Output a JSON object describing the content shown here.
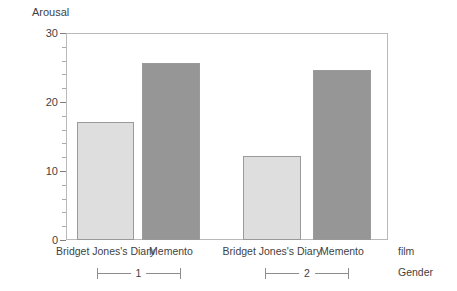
{
  "chart_data": {
    "type": "bar",
    "title": "",
    "ylabel": "Arousal",
    "xlabel": "film",
    "group_axis_label": "Gender",
    "ylim": [
      0,
      30
    ],
    "yticks": [
      0,
      10,
      20,
      30
    ],
    "ytick_labels": [
      "0",
      "10",
      "20",
      "30"
    ],
    "minor_tick_interval": 2,
    "grid": false,
    "legend": "none",
    "categories": [
      "Bridget Jones's Diary",
      "Memento"
    ],
    "groups": [
      {
        "label": "1",
        "bars": [
          {
            "category": "Bridget Jones's Diary",
            "value": 17.1,
            "color": "#dedede"
          },
          {
            "category": "Memento",
            "value": 25.6,
            "color": "#969696"
          }
        ]
      },
      {
        "label": "2",
        "bars": [
          {
            "category": "Bridget Jones's Diary",
            "value": 12.2,
            "color": "#dedede"
          },
          {
            "category": "Memento",
            "value": 24.6,
            "color": "#969696"
          }
        ]
      }
    ],
    "series": [
      {
        "name": "Bridget Jones's Diary",
        "values": [
          17.1,
          12.2
        ]
      },
      {
        "name": "Memento",
        "values": [
          25.6,
          24.6
        ]
      }
    ],
    "colors": {
      "light_bar": "#dedede",
      "dark_bar": "#969696",
      "bar_border": "#9a9a9a",
      "frame": "#b9b9b9",
      "text": "#3f3f3f"
    }
  }
}
